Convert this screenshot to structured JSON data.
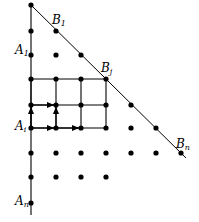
{
  "figure": {
    "background_color": "#ffffff",
    "ink_color": "#000000",
    "width": 199,
    "height": 222,
    "labels": [
      {
        "id": "A1",
        "base": "A",
        "sub": "1",
        "x": 15,
        "y": 44,
        "name": "label-a-1"
      },
      {
        "id": "Ai",
        "base": "A",
        "sub": "i",
        "x": 15,
        "y": 120,
        "name": "label-a-i"
      },
      {
        "id": "An",
        "base": "A",
        "sub": "n",
        "x": 15,
        "y": 195,
        "name": "label-a-n"
      },
      {
        "id": "B1",
        "base": "B",
        "sub": "1",
        "x": 52,
        "y": 14,
        "name": "label-b-1"
      },
      {
        "id": "Bj",
        "base": "B",
        "sub": "j",
        "x": 101,
        "y": 62,
        "name": "label-b-j"
      },
      {
        "id": "Bn",
        "base": "B",
        "sub": "n",
        "x": 176,
        "y": 138,
        "name": "label-b-n"
      }
    ],
    "axis": {
      "name": "vertical-axis-line",
      "x": 31,
      "y_top": 5,
      "y_bottom": 215
    },
    "diagonal": {
      "name": "diagonal-hypotenuse-line",
      "x1": 31,
      "y1": 5,
      "x2": 186,
      "y2": 158
    },
    "grid": {
      "columns_x": [
        31,
        56,
        81,
        106,
        131,
        156
      ],
      "rows_y": [
        5,
        31,
        55,
        79,
        105,
        128,
        153,
        177,
        203
      ],
      "dot_radius": 2.6
    },
    "dots": [
      {
        "x": 31,
        "y": 5
      },
      {
        "x": 31,
        "y": 31
      },
      {
        "x": 31,
        "y": 55
      },
      {
        "x": 31,
        "y": 79
      },
      {
        "x": 31,
        "y": 105
      },
      {
        "x": 31,
        "y": 128
      },
      {
        "x": 31,
        "y": 153
      },
      {
        "x": 31,
        "y": 177
      },
      {
        "x": 31,
        "y": 203
      },
      {
        "x": 56,
        "y": 31
      },
      {
        "x": 56,
        "y": 55
      },
      {
        "x": 56,
        "y": 79
      },
      {
        "x": 56,
        "y": 105
      },
      {
        "x": 56,
        "y": 128
      },
      {
        "x": 56,
        "y": 153
      },
      {
        "x": 56,
        "y": 177
      },
      {
        "x": 81,
        "y": 55
      },
      {
        "x": 81,
        "y": 79
      },
      {
        "x": 81,
        "y": 105
      },
      {
        "x": 81,
        "y": 128
      },
      {
        "x": 81,
        "y": 153
      },
      {
        "x": 81,
        "y": 177
      },
      {
        "x": 106,
        "y": 79
      },
      {
        "x": 106,
        "y": 105
      },
      {
        "x": 106,
        "y": 128
      },
      {
        "x": 106,
        "y": 153
      },
      {
        "x": 106,
        "y": 177
      },
      {
        "x": 131,
        "y": 105
      },
      {
        "x": 131,
        "y": 128
      },
      {
        "x": 131,
        "y": 153
      },
      {
        "x": 156,
        "y": 128
      },
      {
        "x": 156,
        "y": 153
      },
      {
        "x": 181,
        "y": 153
      }
    ],
    "rectangle": {
      "name": "highlighted-lattice-rectangle",
      "x_left": 31,
      "x_right": 106,
      "y_top": 79,
      "y_bottom": 128,
      "inner_columns_x": [
        56,
        81
      ],
      "inner_rows_y": [
        105
      ]
    },
    "arrows": [
      {
        "name": "arrow-right-row-ai-seg1",
        "x1": 31,
        "y1": 128,
        "x2": 54,
        "y2": 128,
        "dir": "right"
      },
      {
        "name": "arrow-right-row-ai-seg2",
        "x1": 56,
        "y1": 128,
        "x2": 79,
        "y2": 128,
        "dir": "right"
      },
      {
        "name": "arrow-right-row-mid-seg1",
        "x1": 31,
        "y1": 105,
        "x2": 54,
        "y2": 105,
        "dir": "right"
      },
      {
        "name": "arrow-up-col-left",
        "x1": 31,
        "y1": 128,
        "x2": 31,
        "y2": 107,
        "dir": "up"
      },
      {
        "name": "arrow-up-col-second",
        "x1": 56,
        "y1": 128,
        "x2": 56,
        "y2": 107,
        "dir": "up"
      }
    ]
  }
}
